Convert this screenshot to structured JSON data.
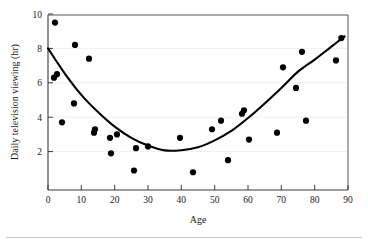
{
  "chart_data": {
    "type": "scatter",
    "title": "",
    "xlabel": "Age",
    "ylabel": "Daily television viewing (hr)",
    "xlim": [
      0,
      90
    ],
    "ylim": [
      0,
      10
    ],
    "xticks": [
      0,
      10,
      20,
      30,
      40,
      50,
      60,
      70,
      80,
      90
    ],
    "yticks": [
      2,
      4,
      6,
      8,
      10
    ],
    "grid": true,
    "legend": "none",
    "point_color": "#000000",
    "curve_color": "#000000",
    "points": [
      {
        "x": 2.1,
        "y": 9.5
      },
      {
        "x": 1.8,
        "y": 6.3
      },
      {
        "x": 2.7,
        "y": 6.5
      },
      {
        "x": 4.2,
        "y": 3.7
      },
      {
        "x": 7.8,
        "y": 4.8
      },
      {
        "x": 8.1,
        "y": 8.2
      },
      {
        "x": 12.3,
        "y": 7.4
      },
      {
        "x": 13.8,
        "y": 3.1
      },
      {
        "x": 14.1,
        "y": 3.3
      },
      {
        "x": 18.6,
        "y": 2.8
      },
      {
        "x": 18.9,
        "y": 1.9
      },
      {
        "x": 20.7,
        "y": 3.0
      },
      {
        "x": 25.8,
        "y": 0.9
      },
      {
        "x": 26.4,
        "y": 2.2
      },
      {
        "x": 30.0,
        "y": 2.3
      },
      {
        "x": 39.6,
        "y": 2.8
      },
      {
        "x": 43.5,
        "y": 0.8
      },
      {
        "x": 49.2,
        "y": 3.3
      },
      {
        "x": 51.9,
        "y": 3.8
      },
      {
        "x": 54.0,
        "y": 1.5
      },
      {
        "x": 58.2,
        "y": 4.2
      },
      {
        "x": 58.8,
        "y": 4.4
      },
      {
        "x": 60.3,
        "y": 2.7
      },
      {
        "x": 68.7,
        "y": 3.1
      },
      {
        "x": 70.5,
        "y": 6.9
      },
      {
        "x": 74.4,
        "y": 5.7
      },
      {
        "x": 76.2,
        "y": 7.8
      },
      {
        "x": 77.4,
        "y": 3.8
      },
      {
        "x": 86.4,
        "y": 7.3
      },
      {
        "x": 88.0,
        "y": 8.6
      }
    ],
    "fit_curve": {
      "shape": "quadratic",
      "description": "U-shaped fitted curve, minimum near age 36",
      "minimum": {
        "x": 36.0,
        "y": 2.05
      },
      "endpoints": [
        {
          "x": 0,
          "y": 8.0
        },
        {
          "x": 89,
          "y": 8.7
        }
      ],
      "samples": [
        {
          "x": 0,
          "y": 8.0
        },
        {
          "x": 5,
          "y": 6.55
        },
        {
          "x": 10,
          "y": 5.3
        },
        {
          "x": 15,
          "y": 4.3
        },
        {
          "x": 20,
          "y": 3.45
        },
        {
          "x": 25,
          "y": 2.8
        },
        {
          "x": 30,
          "y": 2.35
        },
        {
          "x": 35,
          "y": 2.07
        },
        {
          "x": 40,
          "y": 2.08
        },
        {
          "x": 45,
          "y": 2.25
        },
        {
          "x": 50,
          "y": 2.65
        },
        {
          "x": 55,
          "y": 3.2
        },
        {
          "x": 60,
          "y": 3.95
        },
        {
          "x": 65,
          "y": 4.8
        },
        {
          "x": 70,
          "y": 5.7
        },
        {
          "x": 75,
          "y": 6.65
        },
        {
          "x": 80,
          "y": 7.35
        },
        {
          "x": 85,
          "y": 8.1
        },
        {
          "x": 89,
          "y": 8.7
        }
      ]
    }
  },
  "axes": {
    "y_title": "Daily television viewing (hr)",
    "x_title": "Age",
    "y_tick_labels": [
      "10",
      "8",
      "6",
      "4",
      "2"
    ],
    "x_tick_labels": [
      "0",
      "10",
      "20",
      "30",
      "40",
      "50",
      "60",
      "70",
      "80",
      "90"
    ]
  }
}
